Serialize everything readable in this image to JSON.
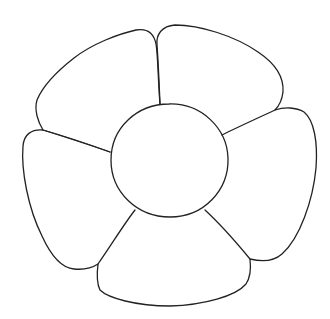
{
  "image": {
    "subject": "flower line drawing",
    "width": 330,
    "height": 319,
    "background": "#ffffff",
    "line_color": "#222222",
    "petal_count": 5,
    "parts": [
      "center",
      "petal-top-left",
      "petal-top-right",
      "petal-right",
      "petal-bottom",
      "petal-left"
    ]
  }
}
